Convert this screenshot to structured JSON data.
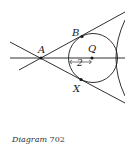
{
  "diagram": {
    "points": {
      "A": {
        "label": "A"
      },
      "B": {
        "label": "B"
      },
      "Q": {
        "label": "Q"
      },
      "X": {
        "label": "X"
      }
    },
    "radius_label": "2",
    "stroke_color": "#1a1a1a"
  },
  "caption": {
    "word": "Diagram",
    "number": "702"
  }
}
